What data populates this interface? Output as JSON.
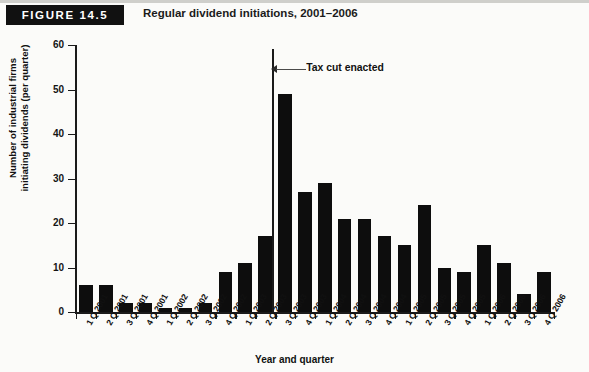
{
  "figure": {
    "badge_label": "FIGURE 14.5",
    "title": "Regular dividend initiations, 2001–2006"
  },
  "chart_data": {
    "type": "bar",
    "title": "Regular dividend initiations, 2001–2006",
    "xlabel": "Year and quarter",
    "ylabel": "Number of industrial firms initiating dividends (per quarter)",
    "ylabel_line1": "Number of industrial firms",
    "ylabel_line2": "initiating dividends (per quarter)",
    "ylim": [
      0,
      60
    ],
    "yticks": [
      0,
      10,
      20,
      30,
      40,
      50,
      60
    ],
    "grid": false,
    "legend": "none",
    "bar_color": "#0d0d0d",
    "categories": [
      "1 Q 2001",
      "2 Q 2001",
      "3 Q 2001",
      "4 Q 2001",
      "1 Q 2002",
      "2 Q 2002",
      "3 Q 2002",
      "4 Q 2002",
      "1 Q 2003",
      "2 Q 2003",
      "3 Q 2003",
      "4 Q 2003",
      "1 Q 2004",
      "2 Q 2004",
      "3 Q 2004",
      "4 Q 2004",
      "1 Q 2005",
      "2 Q 2005",
      "3 Q 2005",
      "4 Q 2005",
      "1 Q 2006",
      "2 Q 2006",
      "3 Q 2006",
      "4 Q 2006"
    ],
    "values": [
      6,
      6,
      2,
      2,
      1,
      1,
      2,
      9,
      11,
      17,
      49,
      27,
      29,
      21,
      21,
      17,
      15,
      24,
      10,
      9,
      15,
      11,
      4,
      9
    ],
    "annotations": [
      {
        "label": "Tax cut enacted",
        "type": "vertical-line-with-arrow",
        "at_category_boundary": "2 Q 2003 / 3 Q 2003",
        "line_top_value": 59
      }
    ]
  }
}
